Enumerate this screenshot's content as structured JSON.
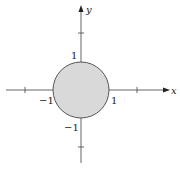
{
  "diagram": {
    "type": "coordinate-plane",
    "axes": {
      "x_label": "x",
      "y_label": "y"
    },
    "region": {
      "shape": "disk",
      "center": [
        0,
        0
      ],
      "radius": 1,
      "fill": "#d9d9d9",
      "stroke": "#555555"
    },
    "tick_labels": {
      "y_pos": "1",
      "y_neg": "−1",
      "x_pos": "1",
      "x_neg": "−1"
    },
    "colors": {
      "axis": "#555555",
      "text": "#222222"
    }
  }
}
